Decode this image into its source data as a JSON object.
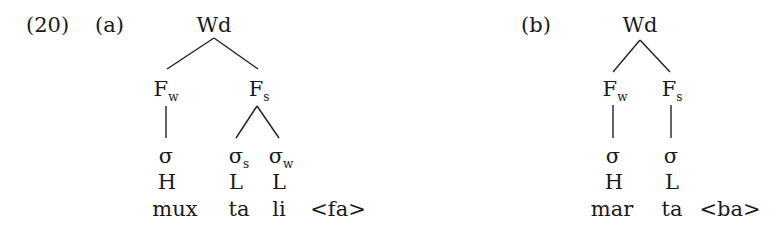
{
  "example_number": "(20)",
  "trees": [
    {
      "label": "(a)",
      "root": "Wd",
      "feet": [
        {
          "base": "F",
          "sub": "w"
        },
        {
          "base": "F",
          "sub": "s"
        }
      ],
      "syllables": [
        {
          "base": "σ",
          "sub": ""
        },
        {
          "base": "σ",
          "sub": "s"
        },
        {
          "base": "σ",
          "sub": "w"
        }
      ],
      "weights": [
        "H",
        "L",
        "L"
      ],
      "segments": [
        "mux",
        "ta",
        "li"
      ],
      "extrametrical": "<fa>"
    },
    {
      "label": "(b)",
      "root": "Wd",
      "feet": [
        {
          "base": "F",
          "sub": "w"
        },
        {
          "base": "F",
          "sub": "s"
        }
      ],
      "syllables": [
        {
          "base": "σ",
          "sub": ""
        },
        {
          "base": "σ",
          "sub": ""
        }
      ],
      "weights": [
        "H",
        "L"
      ],
      "segments": [
        "mar",
        "ta"
      ],
      "extrametrical": "<ba>"
    }
  ]
}
